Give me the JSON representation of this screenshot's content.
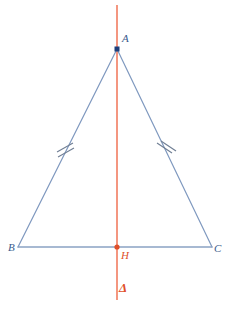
{
  "figure": {
    "canvas": {
      "width": 232,
      "height": 309,
      "background": "#ffffff"
    },
    "colors": {
      "triangle_stroke": "#7f99bf",
      "axis_stroke": "#ef6a4a",
      "vertex_point_fill": "#1f3f7a",
      "foot_point_fill": "#e0502a",
      "tick_stroke": "#6f7e94",
      "label_blue": "#3a5a8c",
      "label_red": "#e0502a"
    },
    "points": [
      {
        "name": "A",
        "label": "A",
        "x": 117,
        "y": 49,
        "marker": "square",
        "color": "#1f3f7a"
      },
      {
        "name": "B",
        "label": "B",
        "x": 18,
        "y": 247,
        "marker": "none",
        "color": "#3a5a8c"
      },
      {
        "name": "C",
        "label": "C",
        "x": 212,
        "y": 247,
        "marker": "none",
        "color": "#3a5a8c"
      },
      {
        "name": "H",
        "label": "H",
        "x": 117,
        "y": 247,
        "marker": "round",
        "color": "#e0502a"
      }
    ],
    "segments": [
      {
        "name": "AB",
        "from": "A",
        "to": "B",
        "ticks": 2
      },
      {
        "name": "AC",
        "from": "A",
        "to": "C",
        "ticks": 2
      },
      {
        "name": "BC",
        "from": "B",
        "to": "C",
        "ticks": 0
      }
    ],
    "axis": {
      "name": "Delta",
      "label": "Δ",
      "x": 117,
      "y_start": 5,
      "y_end": 300
    },
    "labels": {
      "A": "A",
      "B": "B",
      "C": "C",
      "H": "H",
      "delta": "Δ"
    }
  }
}
